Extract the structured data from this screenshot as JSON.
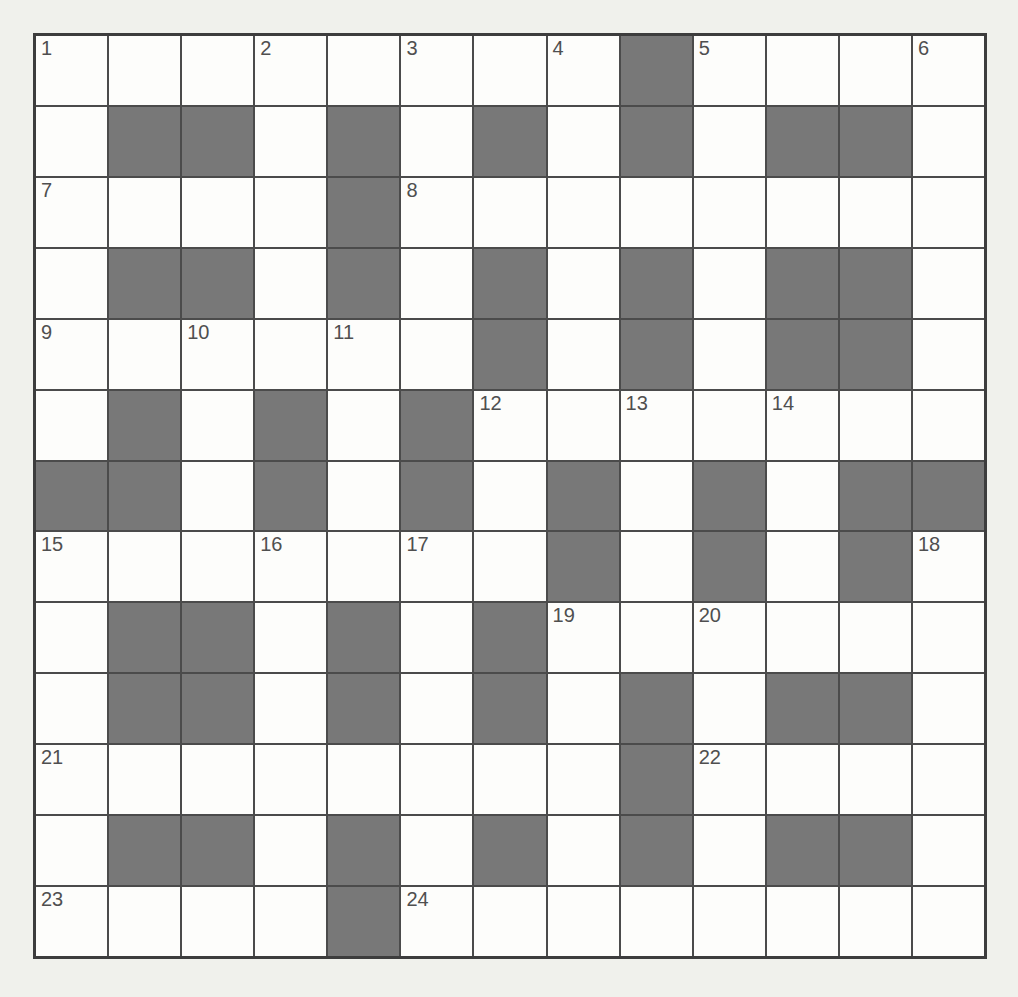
{
  "puzzle": {
    "kind": "crossword-grid",
    "rows": 13,
    "cols": 13,
    "black_cells": [
      [
        0,
        8
      ],
      [
        1,
        1
      ],
      [
        1,
        2
      ],
      [
        1,
        4
      ],
      [
        1,
        6
      ],
      [
        1,
        8
      ],
      [
        1,
        10
      ],
      [
        1,
        11
      ],
      [
        2,
        4
      ],
      [
        3,
        1
      ],
      [
        3,
        2
      ],
      [
        3,
        4
      ],
      [
        3,
        6
      ],
      [
        3,
        8
      ],
      [
        3,
        10
      ],
      [
        3,
        11
      ],
      [
        4,
        6
      ],
      [
        4,
        8
      ],
      [
        4,
        10
      ],
      [
        4,
        11
      ],
      [
        5,
        1
      ],
      [
        5,
        3
      ],
      [
        5,
        5
      ],
      [
        6,
        0
      ],
      [
        6,
        1
      ],
      [
        6,
        3
      ],
      [
        6,
        5
      ],
      [
        6,
        7
      ],
      [
        6,
        9
      ],
      [
        6,
        11
      ],
      [
        6,
        12
      ],
      [
        7,
        7
      ],
      [
        7,
        9
      ],
      [
        7,
        11
      ],
      [
        8,
        1
      ],
      [
        8,
        2
      ],
      [
        8,
        4
      ],
      [
        8,
        6
      ],
      [
        9,
        1
      ],
      [
        9,
        2
      ],
      [
        9,
        4
      ],
      [
        9,
        6
      ],
      [
        9,
        8
      ],
      [
        9,
        10
      ],
      [
        9,
        11
      ],
      [
        10,
        8
      ],
      [
        11,
        1
      ],
      [
        11,
        2
      ],
      [
        11,
        4
      ],
      [
        11,
        6
      ],
      [
        11,
        8
      ],
      [
        11,
        10
      ],
      [
        11,
        11
      ],
      [
        12,
        4
      ]
    ],
    "numbers": [
      {
        "n": "1",
        "row": 0,
        "col": 0
      },
      {
        "n": "2",
        "row": 0,
        "col": 3
      },
      {
        "n": "3",
        "row": 0,
        "col": 5
      },
      {
        "n": "4",
        "row": 0,
        "col": 7
      },
      {
        "n": "5",
        "row": 0,
        "col": 9
      },
      {
        "n": "6",
        "row": 0,
        "col": 12
      },
      {
        "n": "7",
        "row": 2,
        "col": 0
      },
      {
        "n": "8",
        "row": 2,
        "col": 5
      },
      {
        "n": "9",
        "row": 4,
        "col": 0
      },
      {
        "n": "10",
        "row": 4,
        "col": 2
      },
      {
        "n": "11",
        "row": 4,
        "col": 4
      },
      {
        "n": "12",
        "row": 5,
        "col": 6
      },
      {
        "n": "13",
        "row": 5,
        "col": 8
      },
      {
        "n": "14",
        "row": 5,
        "col": 10
      },
      {
        "n": "15",
        "row": 7,
        "col": 0
      },
      {
        "n": "16",
        "row": 7,
        "col": 3
      },
      {
        "n": "17",
        "row": 7,
        "col": 5
      },
      {
        "n": "18",
        "row": 7,
        "col": 12
      },
      {
        "n": "19",
        "row": 8,
        "col": 7
      },
      {
        "n": "20",
        "row": 8,
        "col": 9
      },
      {
        "n": "21",
        "row": 10,
        "col": 0
      },
      {
        "n": "22",
        "row": 10,
        "col": 9
      },
      {
        "n": "23",
        "row": 12,
        "col": 0
      },
      {
        "n": "24",
        "row": 12,
        "col": 5
      }
    ]
  },
  "colors": {
    "page_bg": "#f0f1ec",
    "cell_white": "#fdfdfb",
    "cell_black": "#787878",
    "grid_line": "#4b4b4b",
    "outer_border": "#3d3d3d",
    "number_color": "#4f4f4f"
  }
}
